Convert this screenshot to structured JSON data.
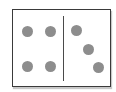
{
  "domino": {
    "left_value": 4,
    "right_value": 3,
    "pip_color": "#8d8d8d",
    "border_color": "#3a3a3a",
    "background_color": "#ffffff",
    "left_pips": [
      {
        "x": 9,
        "y": 16
      },
      {
        "x": 32,
        "y": 16
      },
      {
        "x": 9,
        "y": 51
      },
      {
        "x": 32,
        "y": 51
      }
    ],
    "right_pips": [
      {
        "x": 58,
        "y": 15
      },
      {
        "x": 70,
        "y": 34
      },
      {
        "x": 80,
        "y": 52
      }
    ]
  }
}
